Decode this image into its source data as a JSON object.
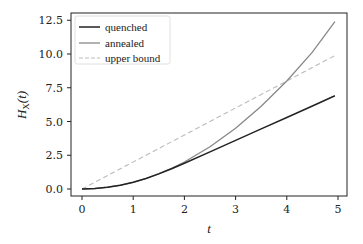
{
  "chart_data": {
    "type": "line",
    "title": "",
    "xlabel": "t",
    "ylabel": "H_X(t)",
    "xlim": [
      -0.22,
      5.18
    ],
    "ylim": [
      -0.55,
      13.1
    ],
    "xticks": [
      0,
      1,
      2,
      3,
      4,
      5
    ],
    "xtick_labels": [
      "0",
      "1",
      "2",
      "3",
      "4",
      "5"
    ],
    "yticks": [
      0.0,
      2.5,
      5.0,
      7.5,
      10.0,
      12.5
    ],
    "ytick_labels": [
      "0.0",
      "2.5",
      "5.0",
      "7.5",
      "10.0",
      "12.5"
    ],
    "grid": false,
    "legend_position": "upper left",
    "series": [
      {
        "name": "quenched",
        "color": "#222222",
        "style": "solid",
        "x": [
          0,
          0.25,
          0.5,
          0.75,
          1.0,
          1.25,
          1.5,
          1.75,
          2.0,
          2.5,
          3.0,
          3.5,
          4.0,
          4.5,
          4.94
        ],
        "y": [
          0,
          0.03,
          0.13,
          0.28,
          0.5,
          0.78,
          1.12,
          1.5,
          1.9,
          2.75,
          3.6,
          4.45,
          5.3,
          6.15,
          6.9
        ]
      },
      {
        "name": "annealed",
        "color": "#888888",
        "style": "solid",
        "x": [
          0,
          0.25,
          0.5,
          0.75,
          1.0,
          1.25,
          1.5,
          1.75,
          2.0,
          2.5,
          3.0,
          3.5,
          4.0,
          4.5,
          4.94
        ],
        "y": [
          0,
          0.03,
          0.13,
          0.28,
          0.5,
          0.78,
          1.13,
          1.53,
          2.0,
          3.13,
          4.5,
          6.13,
          8.0,
          10.13,
          12.4
        ]
      },
      {
        "name": "upper bound",
        "color": "#bbbbbb",
        "style": "dashed",
        "x": [
          0,
          4.94
        ],
        "y": [
          0,
          9.88
        ]
      }
    ]
  },
  "legend": {
    "items": [
      {
        "label": "quenched"
      },
      {
        "label": "annealed"
      },
      {
        "label": "upper bound"
      }
    ]
  },
  "axes": {
    "xlabel": "t",
    "ylabel_main": "H",
    "ylabel_sub": "X",
    "ylabel_arg": "(t)"
  }
}
